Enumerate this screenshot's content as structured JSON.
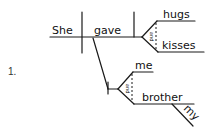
{
  "problem": {
    "number": "1."
  },
  "diagram": {
    "subject": "She",
    "verb": "gave",
    "direct_objects": [
      "hugs",
      "kisses"
    ],
    "direct_object_conjunction": "and",
    "indirect_objects": [
      "me",
      "brother"
    ],
    "indirect_object_conjunction": "and",
    "modifier_brother": "my"
  },
  "colors": {
    "ink": "#1a1a1a",
    "background": "#ffffff"
  }
}
